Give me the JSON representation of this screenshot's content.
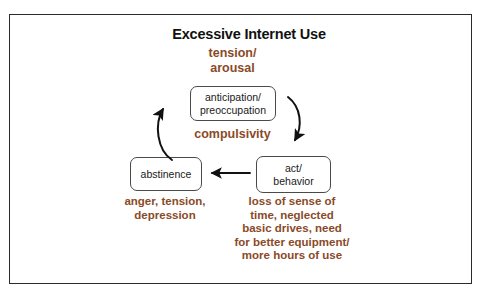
{
  "figure": {
    "title": "Excessive Internet Use",
    "background_color": "#ffffff",
    "frame_color": "#2b2b2b",
    "accent_color": "#8a4a28",
    "node_text_color": "#1a1a1a",
    "node_border_color": "#4a4a4a",
    "arrow_color": "#111111"
  },
  "nodes": {
    "anticipation": {
      "line1": "anticipation/",
      "line2": "preoccupation"
    },
    "abstinence": {
      "line1": "abstinence"
    },
    "act": {
      "line1": "act/",
      "line2": "behavior"
    }
  },
  "annotations": {
    "tension_arousal": {
      "line1": "tension/",
      "line2": "arousal"
    },
    "compulsivity": {
      "line1": "compulsivity"
    },
    "anger_depression": {
      "line1": "anger, tension,",
      "line2": "depression"
    },
    "consequences": {
      "line1": "loss of sense of",
      "line2": "time, neglected",
      "line3": "basic drives, need",
      "line4": "for better equipment/",
      "line5": "more hours of use"
    }
  },
  "arrows": {
    "abstinence_to_anticipation": "curved-arrow-up-right",
    "anticipation_to_act": "curved-arrow-down-right",
    "act_to_abstinence": "straight-arrow-left"
  }
}
